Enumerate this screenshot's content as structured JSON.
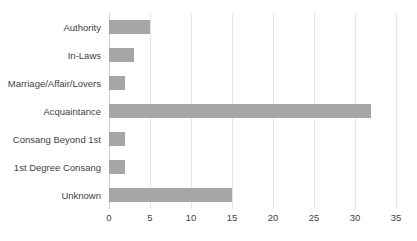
{
  "chart_data": {
    "type": "bar",
    "orientation": "horizontal",
    "title": "",
    "xlabel": "",
    "ylabel": "",
    "categories": [
      "Authority",
      "In-Laws",
      "Marriage/Affair/Lovers",
      "Acquaintance",
      "Consang Beyond 1st",
      "1st Degree Consang",
      "Unknown"
    ],
    "values": [
      5,
      3,
      2,
      32,
      2,
      2,
      15
    ],
    "xticks": [
      0,
      5,
      10,
      15,
      20,
      25,
      30,
      35
    ],
    "xlim": [
      0,
      35
    ],
    "grid": true,
    "legend": false,
    "bar_color": "#a6a6a6",
    "gridline_color": "#e6e6e6",
    "axis_color": "#d0d0d0",
    "text_color": "#3f3f3f",
    "background": "#ffffff"
  },
  "title_sliver": ""
}
